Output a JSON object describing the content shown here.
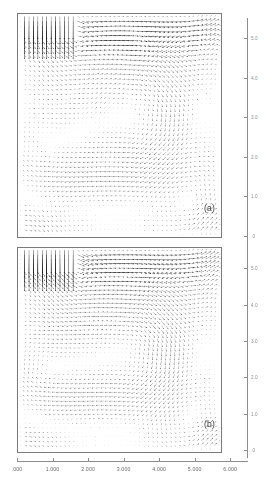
{
  "figure": {
    "title": "",
    "panels": [
      {
        "id": "a",
        "label": "(a)"
      },
      {
        "id": "b",
        "label": "(b)"
      }
    ]
  },
  "chart_data": {
    "type": "scatter",
    "subtype": "vector-field-quiver",
    "title": "",
    "xlabel": "",
    "ylabel": "",
    "panel_count": 2,
    "panels": [
      {
        "name": "(a)",
        "type": "vector-field",
        "xlim": [
          0.0,
          5.3
        ],
        "ylim": [
          0.0,
          5.3
        ],
        "grid": false,
        "description": "Dense velocity vector field in a rectangular cavity with a tall jet inlet along the upper-left boundary; flow turns and forms a large clockwise recirculation occupying the right two-thirds of the domain, with a secondary vortex near the lower-left.",
        "features": {
          "inlet_span_x": [
            0.15,
            1.45
          ],
          "inlet_direction": "downward",
          "primary_vortex_center": [
            2.9,
            2.9
          ],
          "secondary_vortex_center": [
            1.05,
            1.9
          ],
          "grid_nx": 46,
          "grid_ny": 46
        }
      },
      {
        "name": "(b)",
        "type": "vector-field",
        "xlim": [
          0.0,
          5.3
        ],
        "ylim": [
          0.0,
          5.3
        ],
        "grid": false,
        "description": "Same cavity configuration as (a) with a slightly shifted jet penetration depth; clockwise primary recirculation with a flat shear interface near mid-height and a strong secondary vortex in the left half.",
        "features": {
          "inlet_span_x": [
            0.15,
            1.45
          ],
          "inlet_direction": "downward",
          "primary_vortex_center": [
            2.75,
            2.55
          ],
          "secondary_vortex_center": [
            1.0,
            2.0
          ],
          "grid_nx": 46,
          "grid_ny": 46
        }
      }
    ],
    "xaxis": {
      "ticks": [
        0,
        1,
        2,
        3,
        4,
        5,
        6
      ],
      "ticklabels": [
        ".000",
        "1.000",
        "2.000",
        "3.000",
        "4.000",
        "5.000",
        "6.000"
      ],
      "range": [
        0,
        6.5
      ]
    },
    "yaxis_right_panel_a": {
      "ticks": [
        5.0,
        4.0,
        3.0,
        2.0,
        1.0,
        0.0
      ],
      "ticklabels": [
        "5.0",
        "4.0",
        "3.0",
        "2.0",
        "1.0",
        ".0"
      ],
      "range": [
        0,
        5.5
      ]
    },
    "yaxis_right_panel_b": {
      "ticks": [
        5.0,
        4.0,
        3.0,
        2.0,
        1.0,
        0.0
      ],
      "ticklabels": [
        "5.0",
        "4.0",
        "3.0",
        "2.0",
        "1.0",
        ".0"
      ],
      "range": [
        0,
        5.5
      ]
    }
  }
}
